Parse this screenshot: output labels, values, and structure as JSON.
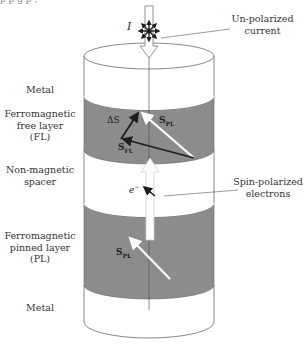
{
  "page": {
    "top_cut_text": "p                    p                    g                    p                    ,"
  },
  "diagram": {
    "current_symbol": "I",
    "callouts": {
      "unpolarized": [
        "Un-polarized",
        "current"
      ],
      "spin_polarized": [
        "Spin-polarized",
        "electrons"
      ]
    },
    "layers": [
      {
        "id": "metal-top",
        "label": [
          "Metal"
        ]
      },
      {
        "id": "free-layer",
        "label": [
          "Ferromagnetic",
          "free layer",
          "(FL)"
        ]
      },
      {
        "id": "spacer",
        "label": [
          "Non-magnetic",
          "spacer"
        ]
      },
      {
        "id": "pinned-layer",
        "label": [
          "Ferromagnetic",
          "pinned layer",
          "(PL)"
        ]
      },
      {
        "id": "metal-bottom",
        "label": [
          "Metal"
        ]
      }
    ],
    "vectors": {
      "delta_s": {
        "symbol": "ΔS"
      },
      "s_pl_free": {
        "symbol": "S",
        "sub": "PL"
      },
      "s_fl": {
        "symbol": "S",
        "sub": "FL"
      },
      "s_pl_pinned": {
        "symbol": "S",
        "sub": "PL"
      },
      "electron": {
        "symbol": "e",
        "sup": "−"
      }
    },
    "colors": {
      "magnetic_layer": "#8c8c8c",
      "outline": "#6a6a6a",
      "vector_dark": "#1e1e1e",
      "vector_light": "#ffffff"
    }
  }
}
